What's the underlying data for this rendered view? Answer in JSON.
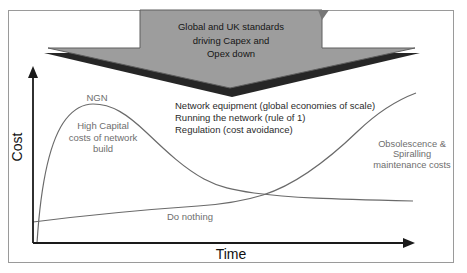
{
  "colors": {
    "banner_fill": "#9d9d9d",
    "banner_border": "#5f5f5f",
    "banner_shadow": "#262626",
    "curve": "#6a6a6a",
    "axis": "#1a1a1a",
    "muted_text": "#6e6e6e",
    "dark_text": "#2b2b2b",
    "frame_border": "#9a9a9a"
  },
  "banner": {
    "text": "Global and UK standards\ndriving Capex and\nOpex down"
  },
  "chart": {
    "type": "conceptual-line-diagram",
    "y_axis_label": "Cost",
    "x_axis_label": "Time",
    "ngn_label": "NGN",
    "ngn_annotation": "High Capital\ncosts of network\nbuild",
    "drivers": "Network equipment (global economies of scale)\nRunning the network (rule of 1)\nRegulation (cost avoidance)",
    "do_nothing_label": "Do nothing",
    "obsolescence_annotation": "Obsolescence &\nSpiralling\nmaintenance costs",
    "series": [
      {
        "name": "NGN",
        "shape": "rises steeply to early peak, falls, flattens low"
      },
      {
        "name": "Do nothing",
        "shape": "starts low, rises slowly then steeply to top right"
      }
    ]
  },
  "svg": {
    "banner_shadow_points": "44,53 420,53 232,97",
    "banner_arrow_points": "140,10 322,10 322,48 415,48 230,88 48,48 140,48",
    "banner_fold_points": "318,10 329,10 322,20",
    "y_axis_path": "M33,243 L33,76",
    "y_axis_arrow_points": "33,66 28,78 38,78",
    "x_axis_path": "M33,243 L405,243",
    "x_axis_arrow_points": "415,243 403,238 403,248",
    "ngn_curve_path": "M37,243 C40,196 47,143 66,119 C74,109 84,104 93,104 C112,104 127,114 147,133 C168,153 184,168 204,179 C219,187 233,190 254,193 C290,198 330,199 413,201",
    "do_nothing_curve_path": "M33,222 C80,216 140,210 198,206 C228,204 247,200 263,195 C298,184 330,158 358,131 C380,110 400,99 416,93"
  }
}
